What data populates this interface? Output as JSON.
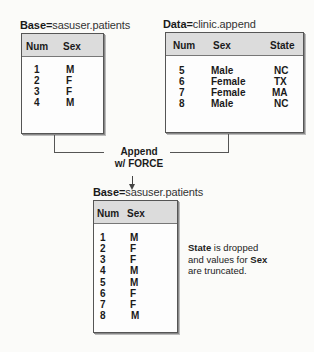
{
  "base_table": {
    "title_keyword": "Base=",
    "title_value": "sasuser.patients",
    "columns": [
      "Num",
      "Sex"
    ],
    "rows": [
      {
        "num": "1",
        "sex": "M"
      },
      {
        "num": "2",
        "sex": "F"
      },
      {
        "num": "3",
        "sex": "F"
      },
      {
        "num": "4",
        "sex": "M"
      }
    ]
  },
  "data_table": {
    "title_keyword": "Data=",
    "title_value": "clinic.append",
    "columns": [
      "Num",
      "Sex",
      "State"
    ],
    "rows": [
      {
        "num": "5",
        "sex": "Male",
        "state": "NC"
      },
      {
        "num": "6",
        "sex": "Female",
        "state": "TX"
      },
      {
        "num": "7",
        "sex": "Female",
        "state": "MA"
      },
      {
        "num": "8",
        "sex": "Male",
        "state": "NC"
      }
    ]
  },
  "operation": {
    "line1": "Append",
    "line2": "w/ FORCE",
    "arrow": "↓"
  },
  "result_table": {
    "title_keyword": "Base=",
    "title_value": "sasuser.patients",
    "columns": [
      "Num",
      "Sex"
    ],
    "rows": [
      {
        "num": "1",
        "sex": "M"
      },
      {
        "num": "2",
        "sex": "F"
      },
      {
        "num": "3",
        "sex": "F"
      },
      {
        "num": "4",
        "sex": "M"
      },
      {
        "num": "5",
        "sex": "M"
      },
      {
        "num": "6",
        "sex": "F"
      },
      {
        "num": "7",
        "sex": "F"
      },
      {
        "num": "8",
        "sex": "M"
      }
    ]
  },
  "note": {
    "part1": "State",
    "part2": " is dropped",
    "part3": "and values for ",
    "part4": "Sex",
    "part5": "are truncated."
  }
}
